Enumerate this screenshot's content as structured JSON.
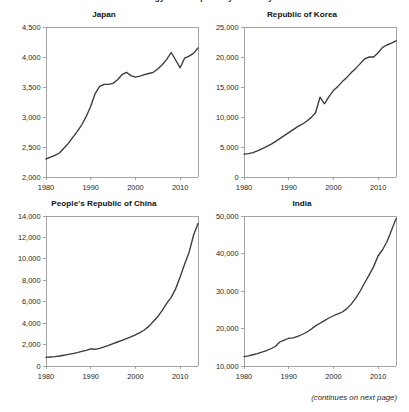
{
  "page": {
    "running_title": "Energy Consumption by Economy",
    "footer_note": "(continues on next page)"
  },
  "chart_data": [
    {
      "type": "line",
      "title": "Japan",
      "xlabel": "",
      "ylabel": "",
      "xlim": [
        1980,
        2014
      ],
      "ylim": [
        2000,
        4500
      ],
      "xticks": [
        1980,
        1990,
        2000,
        2010
      ],
      "xticklabels": [
        "1980",
        "1990",
        "2000",
        "2010"
      ],
      "yticks": [
        2000,
        2500,
        3000,
        3500,
        4000,
        4500
      ],
      "yticklabels": [
        "2,000",
        "2,500",
        "3,000",
        "3,500",
        "4,000",
        "4,500"
      ],
      "grid": false,
      "legend": "none",
      "x": [
        1980,
        1981,
        1982,
        1983,
        1984,
        1985,
        1986,
        1987,
        1988,
        1989,
        1990,
        1991,
        1992,
        1993,
        1994,
        1995,
        1996,
        1997,
        1998,
        1999,
        2000,
        2001,
        2002,
        2003,
        2004,
        2005,
        2006,
        2007,
        2008,
        2009,
        2010,
        2011,
        2012,
        2013,
        2014
      ],
      "values": [
        2300,
        2330,
        2360,
        2400,
        2480,
        2560,
        2660,
        2760,
        2870,
        3010,
        3180,
        3390,
        3510,
        3545,
        3545,
        3560,
        3620,
        3705,
        3745,
        3690,
        3665,
        3680,
        3705,
        3725,
        3745,
        3800,
        3870,
        3960,
        4075,
        3950,
        3820,
        3980,
        4015,
        4060,
        4150
      ]
    },
    {
      "type": "line",
      "title": "Republic of Korea",
      "xlabel": "",
      "ylabel": "",
      "xlim": [
        1980,
        2014
      ],
      "ylim": [
        0,
        25000
      ],
      "xticks": [
        1980,
        1990,
        2000,
        2010
      ],
      "xticklabels": [
        "1980",
        "1990",
        "2000",
        "2010"
      ],
      "yticks": [
        0,
        5000,
        10000,
        15000,
        20000,
        25000
      ],
      "yticklabels": [
        "0",
        "5,000",
        "10,000",
        "15,000",
        "20,000",
        "25,000"
      ],
      "grid": false,
      "legend": "none",
      "x": [
        1980,
        1981,
        1982,
        1983,
        1984,
        1985,
        1986,
        1987,
        1988,
        1989,
        1990,
        1991,
        1992,
        1993,
        1994,
        1995,
        1996,
        1997,
        1998,
        1999,
        2000,
        2001,
        2002,
        2003,
        2004,
        2005,
        2006,
        2007,
        2008,
        2009,
        2010,
        2011,
        2012,
        2013,
        2014
      ],
      "values": [
        3800,
        3900,
        4050,
        4350,
        4700,
        5050,
        5450,
        5900,
        6400,
        6900,
        7400,
        7900,
        8400,
        8800,
        9300,
        9900,
        10700,
        13300,
        12200,
        13400,
        14400,
        15100,
        15900,
        16600,
        17400,
        18100,
        18900,
        19700,
        20000,
        20000,
        20700,
        21600,
        22000,
        22300,
        22700
      ]
    },
    {
      "type": "line",
      "title": "People's Republic of China",
      "xlabel": "",
      "ylabel": "",
      "xlim": [
        1980,
        2014
      ],
      "ylim": [
        0,
        14000
      ],
      "xticks": [
        1980,
        1990,
        2000,
        2010
      ],
      "xticklabels": [
        "1980",
        "1990",
        "2000",
        "2010"
      ],
      "yticks": [
        0,
        2000,
        4000,
        6000,
        8000,
        10000,
        12000,
        14000
      ],
      "yticklabels": [
        "0",
        "2,000",
        "4,000",
        "6,000",
        "8,000",
        "10,000",
        "12,000",
        "14,000"
      ],
      "grid": false,
      "legend": "none",
      "x": [
        1980,
        1981,
        1982,
        1983,
        1984,
        1985,
        1986,
        1987,
        1988,
        1989,
        1990,
        1991,
        1992,
        1993,
        1994,
        1995,
        1996,
        1997,
        1998,
        1999,
        2000,
        2001,
        2002,
        2003,
        2004,
        2005,
        2006,
        2007,
        2008,
        2009,
        2010,
        2011,
        2012,
        2013,
        2014
      ],
      "values": [
        800,
        840,
        880,
        930,
        1000,
        1080,
        1160,
        1250,
        1360,
        1450,
        1600,
        1560,
        1640,
        1780,
        1930,
        2080,
        2240,
        2400,
        2560,
        2720,
        2900,
        3120,
        3360,
        3700,
        4150,
        4600,
        5200,
        5850,
        6400,
        7200,
        8300,
        9500,
        10600,
        12200,
        13300
      ]
    },
    {
      "type": "line",
      "title": "India",
      "xlabel": "",
      "ylabel": "",
      "xlim": [
        1980,
        2014
      ],
      "ylim": [
        10000,
        50000
      ],
      "xticks": [
        1980,
        1990,
        2000,
        2010
      ],
      "xticklabels": [
        "1980",
        "1990",
        "2000",
        "2010"
      ],
      "yticks": [
        10000,
        20000,
        30000,
        40000,
        50000
      ],
      "yticklabels": [
        "10,000",
        "20,000",
        "30,000",
        "40,000",
        "50,000"
      ],
      "grid": false,
      "legend": "none",
      "x": [
        1980,
        1981,
        1982,
        1983,
        1984,
        1985,
        1986,
        1987,
        1988,
        1989,
        1990,
        1991,
        1992,
        1993,
        1994,
        1995,
        1996,
        1997,
        1998,
        1999,
        2000,
        2001,
        2002,
        2003,
        2004,
        2005,
        2006,
        2007,
        2008,
        2009,
        2010,
        2011,
        2012,
        2013,
        2014
      ],
      "values": [
        12500,
        12700,
        13000,
        13300,
        13700,
        14100,
        14600,
        15200,
        16400,
        16900,
        17400,
        17500,
        17900,
        18400,
        19000,
        19800,
        20700,
        21400,
        22100,
        22800,
        23400,
        23900,
        24400,
        25300,
        26500,
        28100,
        30000,
        32200,
        34300,
        36500,
        39400,
        41000,
        43200,
        46200,
        49300
      ]
    }
  ]
}
